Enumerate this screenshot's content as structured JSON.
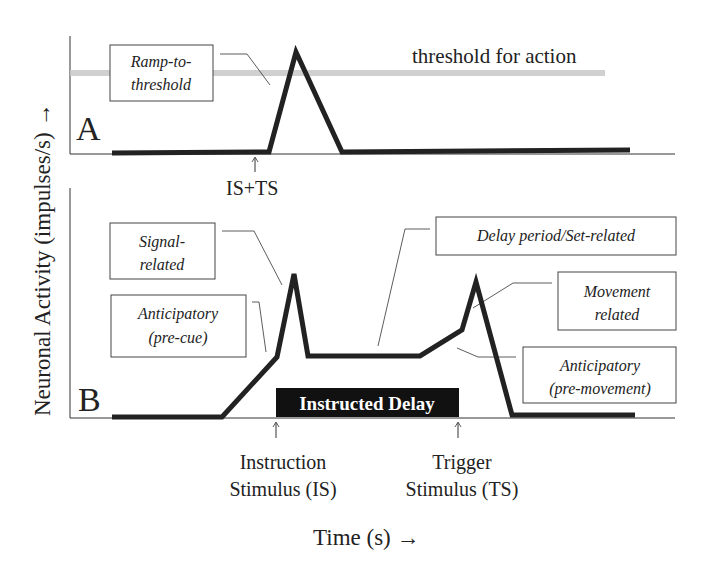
{
  "figure": {
    "y_axis_label": "Neuronal Activity (impulses/s) →",
    "x_axis_label": "Time (s) →",
    "panel_a": {
      "letter": "A",
      "threshold_label": "threshold for action",
      "ramp_label_line1": "Ramp-to-",
      "ramp_label_line2": "threshold",
      "event_label": "IS+TS"
    },
    "panel_b": {
      "letter": "B",
      "signal_label_line1": "Signal-",
      "signal_label_line2": "related",
      "anticip_cue_line1": "Anticipatory",
      "anticip_cue_line2": "(pre-cue)",
      "delay_label": "Delay period/Set-related",
      "movement_line1": "Movement",
      "movement_line2": "related",
      "anticip_move_line1": "Anticipatory",
      "anticip_move_line2": "(pre-movement)",
      "delay_bar_label": "Instructed Delay",
      "is_label_line1": "Instruction",
      "is_label_line2": "Stimulus (IS)",
      "ts_label_line1": "Trigger",
      "ts_label_line2": "Stimulus (TS)"
    },
    "colors": {
      "trace": "#222222",
      "threshold_band": "#c8c8c8",
      "delay_bar": "#111111"
    }
  }
}
